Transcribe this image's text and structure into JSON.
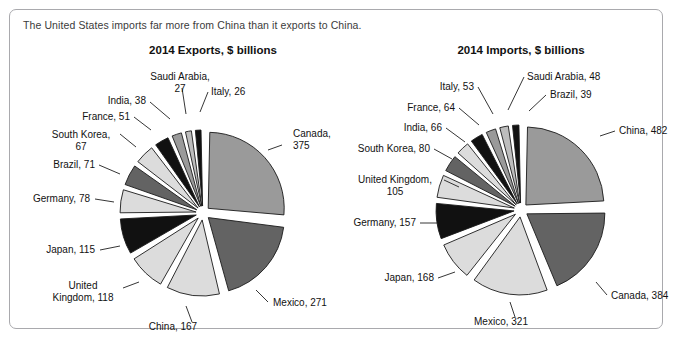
{
  "panel": {
    "caption": "The United States imports far more from China than it exports to China."
  },
  "colors": {
    "border": "#a9a9ad",
    "outline": "#1a1a1a",
    "text": "#121212",
    "shade_light": "#dcdcdc",
    "shade_medium": "#9a9a9a",
    "shade_dark": "#636363",
    "shade_black": "#111111",
    "shade_midlight": "#bdbdbd"
  },
  "chart_data": [
    {
      "type": "pie",
      "title": "2014 Exports, $ billions",
      "unit": "$ billions",
      "year": "2014",
      "center": {
        "x": 193,
        "y": 203
      },
      "radius": 76,
      "start_angle": -90,
      "categories": [
        "Canada",
        "Mexico",
        "China",
        "United Kingdom",
        "Japan",
        "Germany",
        "Brazil",
        "South Korea",
        "France",
        "India",
        "Saudi Arabia",
        "Italy"
      ],
      "values": [
        375,
        271,
        167,
        118,
        115,
        78,
        71,
        67,
        51,
        38,
        27,
        26
      ],
      "labels": [
        "Canada, 375",
        "Mexico, 271",
        "China, 167",
        "United Kingdom, 118",
        "Brazil, 71",
        "Japan, 115",
        "Germany, 78",
        "South Korea, 67",
        "France, 51",
        "India, 38",
        "Saudi Arabia, 27",
        "Italy, 26"
      ],
      "slices": [
        {
          "name": "Canada",
          "value": 375,
          "fill": "#9a9a9a",
          "label_lines": [
            "Canada,",
            "375"
          ],
          "label_x": 283,
          "label_y": 127,
          "anchor": "start",
          "leader": [
            [
              272,
              135
            ],
            [
              258,
              140
            ]
          ]
        },
        {
          "name": "Mexico",
          "value": 271,
          "fill": "#636363",
          "label_lines": [
            "Mexico, 271"
          ],
          "label_x": 263,
          "label_y": 296,
          "anchor": "start",
          "leader": [
            [
              258,
              292
            ],
            [
              246,
              280
            ]
          ]
        },
        {
          "name": "China",
          "value": 167,
          "fill": "#dcdcdc",
          "label_lines": [
            "China, 167"
          ],
          "label_x": 163,
          "label_y": 320,
          "anchor": "middle",
          "leader": [
            [
              182,
              312
            ],
            [
              176,
              296
            ]
          ]
        },
        {
          "name": "United Kingdom",
          "value": 118,
          "fill": "#dcdcdc",
          "label_lines": [
            "United",
            "Kingdom, 118"
          ],
          "label_x": 73,
          "label_y": 279,
          "anchor": "middle",
          "leader": [
            [
              113,
              278
            ],
            [
              129,
              272
            ]
          ]
        },
        {
          "name": "Japan",
          "value": 115,
          "fill": "#111111",
          "label_lines": [
            "Japan, 115"
          ],
          "label_x": 85,
          "label_y": 243,
          "anchor": "end",
          "leader": [
            [
              90,
              240
            ],
            [
              110,
              236
            ]
          ]
        },
        {
          "name": "Germany",
          "value": 78,
          "fill": "#dcdcdc",
          "label_lines": [
            "Germany, 78"
          ],
          "label_x": 80,
          "label_y": 192,
          "anchor": "end",
          "leader": [
            [
              85,
              189
            ],
            [
              104,
              192
            ]
          ]
        },
        {
          "name": "Brazil",
          "value": 71,
          "fill": "#636363",
          "label_lines": [
            "Brazil, 71"
          ],
          "label_x": 85,
          "label_y": 158,
          "anchor": "end",
          "leader": [
            [
              89,
              155
            ],
            [
              110,
              164
            ]
          ]
        },
        {
          "name": "South Korea",
          "value": 67,
          "fill": "#dcdcdc",
          "label_lines": [
            "South Korea,",
            "67"
          ],
          "label_x": 71,
          "label_y": 128,
          "anchor": "middle",
          "leader": [
            [
              110,
              124
            ],
            [
              126,
              137
            ]
          ]
        },
        {
          "name": "France",
          "value": 51,
          "fill": "#111111",
          "label_lines": [
            "France, 51"
          ],
          "label_x": 120,
          "label_y": 110,
          "anchor": "end",
          "leader": [
            [
              124,
              107
            ],
            [
              141,
              120
            ]
          ]
        },
        {
          "name": "India",
          "value": 38,
          "fill": "#9a9a9a",
          "label_lines": [
            "India, 38"
          ],
          "label_x": 136,
          "label_y": 94,
          "anchor": "end",
          "leader": [
            [
              140,
              92
            ],
            [
              160,
              109
            ]
          ]
        },
        {
          "name": "Saudi Arabia",
          "value": 27,
          "fill": "#bdbdbd",
          "label_lines": [
            "Saudi Arabia,",
            "27"
          ],
          "label_x": 170,
          "label_y": 70,
          "anchor": "middle",
          "leader": [
            [
              172,
              78
            ],
            [
              176,
              104
            ]
          ]
        },
        {
          "name": "Italy",
          "value": 26,
          "fill": "#111111",
          "label_lines": [
            "Italy, 26"
          ],
          "label_x": 201,
          "label_y": 85,
          "anchor": "start",
          "leader": [
            [
              198,
              82
            ],
            [
              190,
              102
            ]
          ]
        }
      ]
    },
    {
      "type": "pie",
      "title": "2014 Imports, $ billions",
      "unit": "$ billions",
      "year": "2014",
      "center": {
        "x": 511,
        "y": 200
      },
      "radius": 78,
      "start_angle": -90,
      "categories": [
        "China",
        "Canada",
        "Mexico",
        "Japan",
        "Germany",
        "United Kingdom",
        "South Korea",
        "India",
        "France",
        "Italy",
        "Saudi Arabia",
        "Brazil"
      ],
      "values": [
        482,
        384,
        321,
        168,
        157,
        105,
        80,
        66,
        64,
        53,
        48,
        39
      ],
      "labels": [
        "China, 482",
        "Canada, 384",
        "Mexico, 321",
        "Japan, 168",
        "Germany, 157",
        "United Kingdom, 105",
        "South Korea, 80",
        "India, 66",
        "France, 64",
        "Italy, 53",
        "Saudi Arabia, 48",
        "Brazil, 39"
      ],
      "slices": [
        {
          "name": "China",
          "value": 482,
          "fill": "#9a9a9a",
          "label_lines": [
            "China, 482"
          ],
          "label_x": 609,
          "label_y": 124,
          "anchor": "start",
          "leader": [
            [
              605,
              121
            ],
            [
              590,
              126
            ]
          ]
        },
        {
          "name": "Canada",
          "value": 384,
          "fill": "#636363",
          "label_lines": [
            "Canada, 384"
          ],
          "label_x": 601,
          "label_y": 289,
          "anchor": "start",
          "leader": [
            [
              597,
              285
            ],
            [
              586,
              272
            ]
          ]
        },
        {
          "name": "Mexico",
          "value": 321,
          "fill": "#dcdcdc",
          "label_lines": [
            "Mexico, 321"
          ],
          "label_x": 491,
          "label_y": 315,
          "anchor": "middle",
          "leader": [
            [
              505,
              307
            ],
            [
              500,
              292
            ]
          ]
        },
        {
          "name": "Japan",
          "value": 168,
          "fill": "#dcdcdc",
          "label_lines": [
            "Japan, 168"
          ],
          "label_x": 424,
          "label_y": 271,
          "anchor": "end",
          "leader": [
            [
              428,
              268
            ],
            [
              445,
              262
            ]
          ]
        },
        {
          "name": "Germany",
          "value": 157,
          "fill": "#111111",
          "label_lines": [
            "Germany, 157"
          ],
          "label_x": 406,
          "label_y": 216,
          "anchor": "end",
          "leader": [
            [
              410,
              213
            ],
            [
              427,
              213
            ]
          ]
        },
        {
          "name": "United Kingdom",
          "value": 105,
          "fill": "#dcdcdc",
          "label_lines": [
            "United Kingdom,",
            "105"
          ],
          "label_x": 385,
          "label_y": 173,
          "anchor": "middle",
          "leader": [
            [
              434,
              170
            ],
            [
              449,
              177
            ]
          ]
        },
        {
          "name": "South Korea",
          "value": 80,
          "fill": "#636363",
          "label_lines": [
            "South Korea, 80"
          ],
          "label_x": 420,
          "label_y": 142,
          "anchor": "end",
          "leader": [
            [
              424,
              139
            ],
            [
              442,
              149
            ]
          ]
        },
        {
          "name": "India",
          "value": 66,
          "fill": "#dcdcdc",
          "label_lines": [
            "India, 66"
          ],
          "label_x": 432,
          "label_y": 121,
          "anchor": "end",
          "leader": [
            [
              436,
              118
            ],
            [
              455,
              132
            ]
          ]
        },
        {
          "name": "France",
          "value": 64,
          "fill": "#111111",
          "label_lines": [
            "France, 64"
          ],
          "label_x": 445,
          "label_y": 101,
          "anchor": "end",
          "leader": [
            [
              449,
              98
            ],
            [
              469,
              115
            ]
          ]
        },
        {
          "name": "Italy",
          "value": 53,
          "fill": "#9a9a9a",
          "label_lines": [
            "Italy, 53"
          ],
          "label_x": 464,
          "label_y": 80,
          "anchor": "end",
          "leader": [
            [
              468,
              77
            ],
            [
              483,
              104
            ]
          ]
        },
        {
          "name": "Saudi Arabia",
          "value": 48,
          "fill": "#bdbdbd",
          "label_lines": [
            "Saudi Arabia, 48"
          ],
          "label_x": 517,
          "label_y": 70,
          "anchor": "start",
          "leader": [
            [
              514,
              67
            ],
            [
              498,
              100
            ]
          ]
        },
        {
          "name": "Brazil",
          "value": 39,
          "fill": "#111111",
          "label_lines": [
            "Brazil, 39"
          ],
          "label_x": 540,
          "label_y": 88,
          "anchor": "start",
          "leader": [
            [
              536,
              85
            ],
            [
              519,
              101
            ]
          ]
        }
      ]
    }
  ]
}
